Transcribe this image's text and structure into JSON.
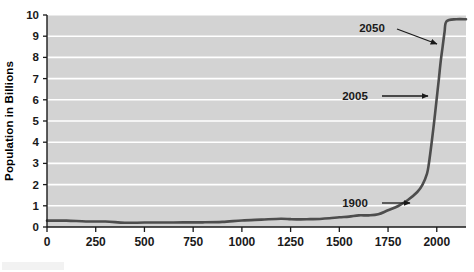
{
  "chart_data": {
    "type": "line",
    "title": "",
    "xlabel": "",
    "ylabel": "Population in Billions",
    "xlim": [
      0,
      2150
    ],
    "ylim": [
      0,
      10
    ],
    "grid": true,
    "legend": "none",
    "plot_background": "#d3d3d3",
    "gridline_color": "#ffffff",
    "line_color": "#4d4d4d",
    "axis_color": "#1a1a1a",
    "xticks": [
      "0",
      "250",
      "500",
      "750",
      "1000",
      "1250",
      "1500",
      "1750",
      "2000"
    ],
    "xtick_values": [
      0,
      250,
      500,
      750,
      1000,
      1250,
      1500,
      1750,
      2000
    ],
    "yticks": [
      "0",
      "1",
      "2",
      "3",
      "4",
      "5",
      "6",
      "7",
      "8",
      "9",
      "10"
    ],
    "ytick_values": [
      0,
      1,
      2,
      3,
      4,
      5,
      6,
      7,
      8,
      9,
      10
    ],
    "x": [
      0,
      100,
      200,
      300,
      400,
      500,
      600,
      700,
      800,
      900,
      1000,
      1100,
      1200,
      1250,
      1300,
      1350,
      1400,
      1450,
      1500,
      1550,
      1600,
      1650,
      1700,
      1750,
      1800,
      1850,
      1900,
      1927,
      1950,
      1960,
      1974,
      1987,
      1999,
      2005,
      2011,
      2020,
      2030,
      2040,
      2050,
      2100,
      2150
    ],
    "y": [
      0.3,
      0.3,
      0.26,
      0.26,
      0.2,
      0.21,
      0.21,
      0.22,
      0.22,
      0.24,
      0.31,
      0.35,
      0.39,
      0.37,
      0.36,
      0.37,
      0.38,
      0.41,
      0.46,
      0.49,
      0.55,
      0.55,
      0.6,
      0.79,
      0.98,
      1.26,
      1.65,
      2.0,
      2.52,
      3.02,
      4.0,
      5.0,
      6.0,
      6.5,
      7.0,
      7.8,
      8.5,
      9.2,
      9.7,
      9.8,
      9.8
    ],
    "annotations": [
      {
        "label": "2050",
        "text_x": 372,
        "text_y": 32,
        "arrow_from_x": 397,
        "arrow_from_y": 29,
        "arrow_to_x": 437,
        "arrow_to_y": 44
      },
      {
        "label": "2005",
        "text_x": 355,
        "text_y": 100,
        "arrow_from_x": 382,
        "arrow_from_y": 96,
        "arrow_to_x": 428,
        "arrow_to_y": 96
      },
      {
        "label": "1900",
        "text_x": 355,
        "text_y": 207,
        "arrow_from_x": 382,
        "arrow_from_y": 203,
        "arrow_to_x": 410,
        "arrow_to_y": 203
      }
    ]
  },
  "figure": {
    "plot_left": 47,
    "plot_top": 15,
    "plot_right": 466,
    "plot_bottom": 227
  }
}
